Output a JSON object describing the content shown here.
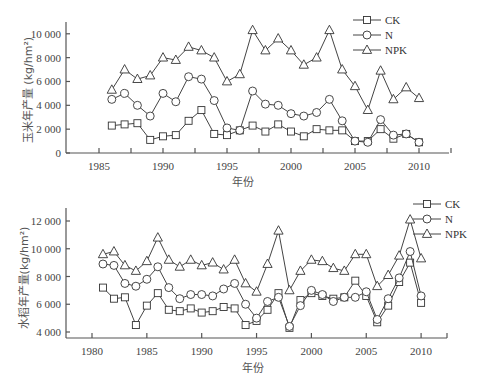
{
  "chart_data": [
    {
      "type": "line",
      "title": "",
      "xlabel": "年份",
      "ylabel": "玉米年产量 (kg/hm²)",
      "xlim": [
        1982,
        2012
      ],
      "ylim": [
        0,
        11000
      ],
      "xticks": [
        1985,
        1990,
        1995,
        2000,
        2005,
        2010
      ],
      "yticks": [
        0,
        2000,
        4000,
        6000,
        8000,
        10000
      ],
      "ytick_labels": [
        "0",
        "2 000",
        "4 000",
        "6 000",
        "8 000",
        "10 000"
      ],
      "grid": false,
      "legend_position": "upper right",
      "x": [
        1986,
        1987,
        1988,
        1989,
        1990,
        1991,
        1992,
        1993,
        1994,
        1995,
        1996,
        1997,
        1998,
        1999,
        2000,
        2001,
        2002,
        2003,
        2004,
        2005,
        2006,
        2007,
        2008,
        2009,
        2010
      ],
      "series": [
        {
          "name": "CK",
          "marker": "square",
          "values": [
            2300,
            2400,
            2500,
            1100,
            1400,
            1500,
            2700,
            3600,
            1600,
            1500,
            1900,
            2300,
            1800,
            2400,
            1800,
            1400,
            2000,
            1900,
            1900,
            1000,
            1000,
            2000,
            1200,
            1600,
            900
          ]
        },
        {
          "name": "N",
          "marker": "circle",
          "values": [
            4500,
            5000,
            4000,
            3100,
            5000,
            4300,
            6400,
            6200,
            4400,
            2100,
            1900,
            5200,
            4100,
            4000,
            3300,
            3100,
            3400,
            4500,
            2700,
            1000,
            900,
            2800,
            1500,
            1600,
            900
          ]
        },
        {
          "name": "NPK",
          "marker": "triangle",
          "values": [
            5300,
            7000,
            6200,
            6500,
            8000,
            7800,
            8900,
            8600,
            8000,
            6000,
            6600,
            10300,
            8600,
            9600,
            8600,
            7400,
            8000,
            10300,
            7000,
            5600,
            3600,
            6900,
            4500,
            5500,
            4600
          ]
        }
      ]
    },
    {
      "type": "line",
      "title": "",
      "xlabel": "年份",
      "ylabel": "水稻年产量(kg/hm²)",
      "xlim": [
        1978,
        2012
      ],
      "ylim": [
        3500,
        13000
      ],
      "xticks": [
        1980,
        1985,
        1990,
        1995,
        2000,
        2005,
        2010
      ],
      "yticks": [
        4000,
        6000,
        8000,
        10000,
        12000
      ],
      "ytick_labels": [
        "4 000",
        "6 000",
        "8 000",
        "10 000",
        "12 000"
      ],
      "grid": false,
      "legend_position": "upper right",
      "x": [
        1981,
        1982,
        1983,
        1984,
        1985,
        1986,
        1987,
        1988,
        1989,
        1990,
        1991,
        1992,
        1993,
        1994,
        1995,
        1996,
        1997,
        1998,
        1999,
        2000,
        2001,
        2002,
        2003,
        2004,
        2005,
        2006,
        2007,
        2008,
        2009,
        2010
      ],
      "series": [
        {
          "name": "CK",
          "marker": "square",
          "values": [
            7200,
            6400,
            6500,
            4500,
            5900,
            6800,
            5600,
            5500,
            5700,
            5400,
            5500,
            5800,
            5700,
            4500,
            4800,
            5600,
            6800,
            4300,
            6300,
            6800,
            6600,
            6400,
            6500,
            7700,
            6600,
            4700,
            5900,
            7600,
            9000,
            6100
          ]
        },
        {
          "name": "N",
          "marker": "circle",
          "values": [
            8900,
            8800,
            7500,
            7300,
            7800,
            8700,
            7200,
            6400,
            6700,
            6700,
            6600,
            7100,
            7500,
            6000,
            5000,
            6200,
            6500,
            4400,
            5900,
            7000,
            6700,
            6200,
            6500,
            6500,
            6900,
            4900,
            6400,
            7900,
            9800,
            6600
          ]
        },
        {
          "name": "NPK",
          "marker": "triangle",
          "values": [
            9600,
            9800,
            8800,
            8400,
            9100,
            10800,
            9200,
            8700,
            9200,
            8800,
            9000,
            8500,
            9200,
            7500,
            6900,
            8900,
            11300,
            7000,
            8400,
            9200,
            9100,
            8600,
            8400,
            9600,
            9600,
            7300,
            8100,
            9500,
            12100,
            9300
          ]
        }
      ]
    }
  ],
  "legend": {
    "labels": [
      "CK",
      "N",
      "NPK"
    ]
  },
  "top_chart": {
    "ylabel": "玉米年产量 (kg/hm²)",
    "xlabel": "年份"
  },
  "bottom_chart": {
    "ylabel": "水稻年产量(kg/hm²)",
    "xlabel": "年份"
  },
  "colors": {
    "line": "#444444",
    "axis": "#555555",
    "marker_fill": "#ffffff"
  }
}
